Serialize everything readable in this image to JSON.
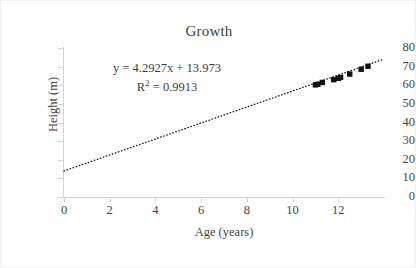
{
  "chart_data": {
    "type": "scatter",
    "title": "Growth",
    "xlabel": "Age (years)",
    "ylabel": "Height (m)",
    "xlim": [
      0,
      14
    ],
    "ylim": [
      0,
      80
    ],
    "xticks": [
      0,
      2,
      4,
      6,
      8,
      10,
      12
    ],
    "yticks": [
      0,
      10,
      20,
      30,
      40,
      50,
      60,
      70,
      80
    ],
    "grid": false,
    "legend": false,
    "series": [
      {
        "name": "Height vs Age",
        "marker": "filled-square",
        "color": "#111111",
        "x": [
          11.0,
          11.1,
          11.3,
          11.8,
          12.0,
          12.1,
          12.5,
          13.0,
          13.3
        ],
        "y": [
          60.2,
          60.5,
          61.5,
          63.0,
          63.7,
          64.2,
          66.0,
          68.6,
          70.2
        ]
      }
    ],
    "trendline": {
      "type": "linear-dotted",
      "equation": "y = 4.2927x + 13.973",
      "r_squared_label": "R",
      "r_squared_exponent": "2",
      "r_squared_value": " = 0.9913",
      "slope": 4.2927,
      "intercept": 13.973,
      "r2": 0.9913,
      "x_start": 0,
      "x_end": 14
    },
    "annotations": [
      "y = 4.2927x + 13.973",
      "R² = 0.9913"
    ]
  },
  "axis": {
    "x_tick_labels": [
      "0",
      "2",
      "4",
      "6",
      "8",
      "10",
      "12"
    ],
    "y_tick_labels": [
      "80",
      "70",
      "60",
      "50",
      "40",
      "30",
      "20",
      "10",
      "0"
    ]
  }
}
